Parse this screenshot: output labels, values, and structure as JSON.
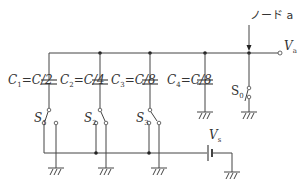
{
  "diagram": {
    "type": "circuit",
    "node_label": "ノード a",
    "output_terminal": {
      "label": "V",
      "sub": "a"
    },
    "source": {
      "label": "V",
      "sub": "s"
    },
    "capacitors": [
      {
        "id": "C1",
        "label": "C",
        "sub": "1",
        "value": "=C/2"
      },
      {
        "id": "C2",
        "label": "C",
        "sub": "2",
        "value": "=C/4"
      },
      {
        "id": "C3",
        "label": "C",
        "sub": "3",
        "value": "=C/8"
      },
      {
        "id": "C4",
        "label": "C",
        "sub": "4",
        "value": "=C/8"
      }
    ],
    "switches": [
      {
        "id": "S1",
        "label": "S",
        "sub": "1"
      },
      {
        "id": "S2",
        "label": "S",
        "sub": "2"
      },
      {
        "id": "S3",
        "label": "S",
        "sub": "3"
      },
      {
        "id": "S0",
        "label": "S",
        "sub": "0"
      }
    ]
  }
}
